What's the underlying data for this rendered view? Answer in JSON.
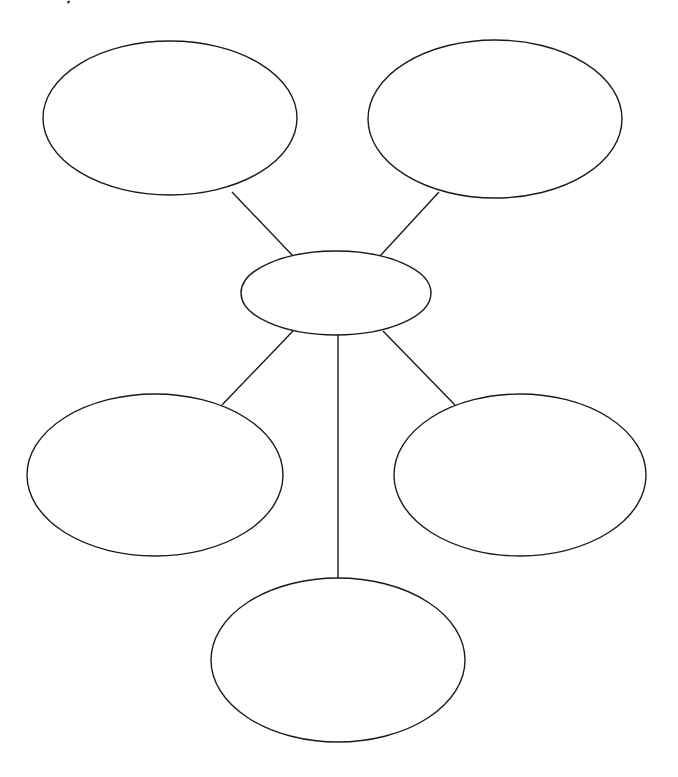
{
  "diagram": {
    "type": "bubble-map",
    "canvas": {
      "width": 678,
      "height": 777,
      "background": "#ffffff"
    },
    "stroke_color": "#1a1a1a",
    "center_node": {
      "id": "center",
      "cx": 336,
      "cy": 293,
      "rx": 95,
      "ry": 42,
      "label": ""
    },
    "nodes": [
      {
        "id": "top-left",
        "cx": 170,
        "cy": 118,
        "rx": 127,
        "ry": 77,
        "label": ""
      },
      {
        "id": "top-right",
        "cx": 495,
        "cy": 119,
        "rx": 127,
        "ry": 79,
        "label": ""
      },
      {
        "id": "middle-left",
        "cx": 155,
        "cy": 475,
        "rx": 128,
        "ry": 81,
        "label": ""
      },
      {
        "id": "middle-right",
        "cx": 520,
        "cy": 475,
        "rx": 126,
        "ry": 81,
        "label": ""
      },
      {
        "id": "bottom",
        "cx": 338,
        "cy": 660,
        "rx": 127,
        "ry": 82,
        "label": ""
      }
    ],
    "edges": [
      {
        "from": "center",
        "to": "top-left",
        "x1": 293,
        "y1": 256,
        "x2": 232,
        "y2": 192
      },
      {
        "from": "center",
        "to": "top-right",
        "x1": 380,
        "y1": 256,
        "x2": 439,
        "y2": 192
      },
      {
        "from": "center",
        "to": "middle-left",
        "x1": 293,
        "y1": 331,
        "x2": 222,
        "y2": 405
      },
      {
        "from": "center",
        "to": "middle-right",
        "x1": 383,
        "y1": 331,
        "x2": 455,
        "y2": 405
      },
      {
        "from": "center",
        "to": "bottom",
        "x1": 338,
        "y1": 334,
        "x2": 338,
        "y2": 579
      }
    ]
  }
}
